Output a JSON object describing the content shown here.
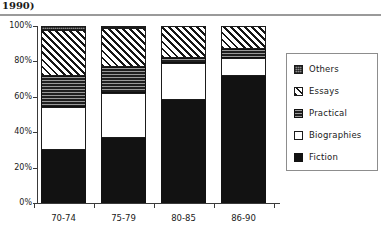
{
  "header": {
    "title_fragment": "1990)"
  },
  "legend": {
    "position": "right",
    "entries": [
      {
        "label": "Others",
        "pattern": "gray-stipple"
      },
      {
        "label": "Essays",
        "pattern": "diagonal-hatch"
      },
      {
        "label": "Practical",
        "pattern": "dark-horizontal-lines"
      },
      {
        "label": "Biographies",
        "pattern": "white-solid"
      },
      {
        "label": "Fiction",
        "pattern": "black-solid"
      }
    ]
  },
  "chart_data": {
    "type": "bar",
    "subtype": "stacked-percentage",
    "title": "",
    "xlabel": "",
    "ylabel": "",
    "ylim": [
      0,
      100
    ],
    "yticks": [
      0,
      20,
      40,
      60,
      80,
      100
    ],
    "ytick_labels": [
      "0%",
      "20%",
      "40%",
      "60%",
      "80%",
      "100%"
    ],
    "grid": false,
    "categories": [
      "70-74",
      "75-79",
      "80-85",
      "86-90"
    ],
    "series": [
      {
        "name": "Fiction",
        "values": [
          30,
          37,
          58,
          72
        ]
      },
      {
        "name": "Biographies",
        "values": [
          24,
          25,
          21,
          10
        ]
      },
      {
        "name": "Practical",
        "values": [
          18,
          15,
          3,
          5
        ]
      },
      {
        "name": "Essays",
        "values": [
          26,
          22,
          18,
          13
        ]
      },
      {
        "name": "Others",
        "values": [
          2,
          1,
          0,
          0
        ]
      }
    ],
    "stack_order_bottom_to_top": [
      "Fiction",
      "Biographies",
      "Practical",
      "Essays",
      "Others"
    ]
  }
}
